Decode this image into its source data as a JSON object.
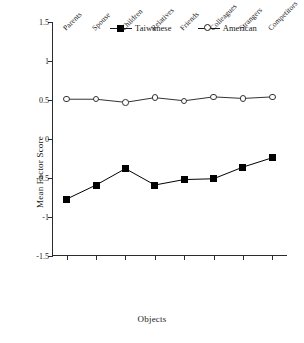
{
  "chart_data": {
    "type": "line",
    "title": "",
    "xlabel": "Objects",
    "ylabel": "Mean Factor Score",
    "ylim": [
      -1.5,
      1.5
    ],
    "yticks": [
      1.5,
      1,
      0.5,
      0,
      -0.5,
      -1,
      -1.5
    ],
    "ytick_labels": [
      "1.5",
      "1",
      "0.5",
      "0",
      "-0.5",
      "-1",
      "-1.5"
    ],
    "grid": false,
    "legend_position": "top-center",
    "categories": [
      "Parents",
      "Spouse",
      "Children",
      "Relatives",
      "Friends",
      "Colleagues",
      "Strangers",
      "Competitors"
    ],
    "series": [
      {
        "name": "Taiwanese",
        "marker": "filled-square",
        "color": "#000000",
        "values": [
          -0.77,
          -0.59,
          -0.38,
          -0.59,
          -0.52,
          -0.51,
          -0.36,
          -0.24
        ]
      },
      {
        "name": "American",
        "marker": "open-circle",
        "color": "#333333",
        "values": [
          0.51,
          0.51,
          0.47,
          0.53,
          0.49,
          0.54,
          0.52,
          0.54
        ]
      }
    ]
  },
  "legend": {
    "entries": [
      {
        "label": "Taiwanese",
        "marker": "filled-square"
      },
      {
        "label": "American",
        "marker": "open-circle"
      }
    ]
  },
  "axis": {
    "x_title": "Objects",
    "y_title": "Mean Factor Score"
  }
}
